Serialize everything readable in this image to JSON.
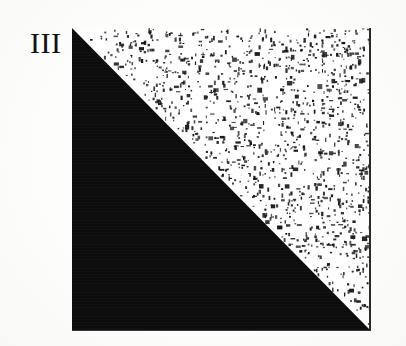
{
  "figure": {
    "plate_label": "III",
    "caption": "",
    "canvas": {
      "width": 406,
      "height": 346,
      "background_color": "#fdfdfc"
    }
  },
  "panel": {
    "left": 72,
    "top": 28,
    "width": 299,
    "height": 303,
    "border_color": "#2a2a2a",
    "background_color": "#ffffff"
  },
  "regions": [
    {
      "name": "lower-left-solid",
      "shape": "triangle",
      "vertices": "top-left, bottom-left, bottom-right",
      "fill": "solid",
      "fill_color": "#0c0c0c",
      "texture": "none"
    },
    {
      "name": "upper-right-stippled",
      "shape": "triangle",
      "vertices": "top-left, top-right, bottom-right",
      "fill": "stipple",
      "fill_color": "#ffffff",
      "speck_color": "#171717",
      "texture": "random-speckle",
      "speck_count": 2600,
      "coverage_percent": 22
    }
  ],
  "chart_data": {
    "type": "heatmap",
    "title": "III",
    "xlabel": "",
    "ylabel": "",
    "categories": [
      "lower-left",
      "upper-right"
    ],
    "values": [
      100,
      22
    ],
    "series": [
      {
        "name": "ink coverage (%)",
        "values": [
          100,
          22
        ]
      }
    ],
    "annotations": [
      "III"
    ],
    "grid": false,
    "legend": "none"
  }
}
